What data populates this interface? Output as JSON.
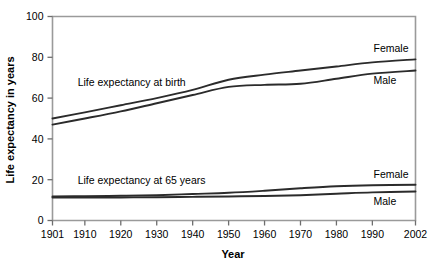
{
  "chart_data": {
    "type": "line",
    "title": "",
    "subtitle": "",
    "xlabel": "Year",
    "ylabel": "Life expectancy in years",
    "xlim": [
      1901,
      2002
    ],
    "ylim": [
      0,
      100
    ],
    "grid": false,
    "legend_position": "inline-right-end-labels",
    "x_ticks": [
      1901,
      1910,
      1920,
      1930,
      1940,
      1950,
      1960,
      1970,
      1980,
      1990,
      2002
    ],
    "x_tick_labels": [
      "1901",
      "1910",
      "1920",
      "1930",
      "1940",
      "1950",
      "1960",
      "1970",
      "1980",
      "1990",
      "2002"
    ],
    "y_ticks": [
      0,
      20,
      40,
      60,
      80,
      100
    ],
    "y_tick_labels": [
      "0",
      "20",
      "40",
      "60",
      "80",
      "100"
    ],
    "annotations": [
      {
        "text": "Life expectancy at birth",
        "x": 1908,
        "y": 66
      },
      {
        "text": "Life expectancy at 65 years",
        "x": 1908,
        "y": 18
      }
    ],
    "series": [
      {
        "name": "Female",
        "group": "Life expectancy at birth",
        "end_label": "Female",
        "x": [
          1901,
          1910,
          1920,
          1930,
          1940,
          1950,
          1960,
          1970,
          1980,
          1990,
          2002
        ],
        "values": [
          50.0,
          53.0,
          56.5,
          60.0,
          64.0,
          69.0,
          71.5,
          73.5,
          75.5,
          77.5,
          79.0
        ]
      },
      {
        "name": "Male",
        "group": "Life expectancy at birth",
        "end_label": "Male",
        "x": [
          1901,
          1910,
          1920,
          1930,
          1940,
          1950,
          1960,
          1970,
          1980,
          1990,
          2002
        ],
        "values": [
          47.0,
          50.0,
          53.5,
          57.5,
          61.5,
          65.5,
          66.5,
          67.0,
          69.5,
          72.0,
          73.5
        ]
      },
      {
        "name": "Female",
        "group": "Life expectancy at 65 years",
        "end_label": "Female",
        "x": [
          1901,
          1910,
          1920,
          1930,
          1940,
          1950,
          1960,
          1970,
          1980,
          1990,
          2002
        ],
        "values": [
          11.8,
          11.9,
          12.1,
          12.4,
          13.0,
          13.6,
          14.6,
          15.8,
          16.8,
          17.3,
          17.5
        ]
      },
      {
        "name": "Male",
        "group": "Life expectancy at 65 years",
        "end_label": "Male",
        "x": [
          1901,
          1910,
          1920,
          1930,
          1940,
          1950,
          1960,
          1970,
          1980,
          1990,
          2002
        ],
        "values": [
          11.3,
          11.2,
          11.3,
          11.4,
          11.6,
          11.8,
          12.0,
          12.4,
          13.1,
          13.8,
          14.2
        ]
      }
    ],
    "colors": {
      "line": "#2b2b2b",
      "axis": "#9a9a9a",
      "tick": "#6e6e6e",
      "text": "#000000",
      "background": "#ffffff"
    }
  }
}
